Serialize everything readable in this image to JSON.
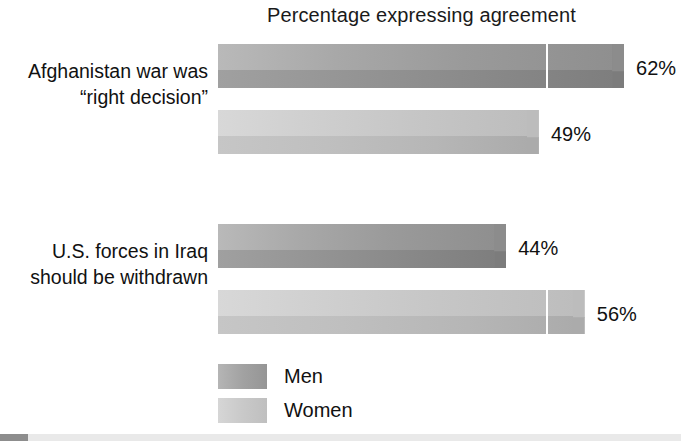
{
  "chart_data": {
    "type": "bar",
    "orientation": "horizontal",
    "style": "grouped-3d-bar",
    "title": "Percentage expressing agreement",
    "xlabel": "",
    "ylabel": "",
    "xlim": [
      0,
      70
    ],
    "grid": true,
    "gridlines": [
      50
    ],
    "legend_position": "bottom-left",
    "categories": [
      "Afghanistan war was “right decision”",
      "U.S. forces in Iraq should be withdrawn"
    ],
    "series": [
      {
        "name": "Men",
        "values": [
          62,
          44
        ],
        "color": "#9a9a9a"
      },
      {
        "name": "Women",
        "values": [
          49,
          56
        ],
        "color": "#c6c6c6"
      }
    ],
    "data_labels": [
      "62%",
      "49%",
      "44%",
      "56%"
    ]
  },
  "title": "Percentage expressing agreement",
  "categories": [
    {
      "line1": "Afghanistan war was",
      "line2": "“right decision”"
    },
    {
      "line1": "U.S. forces in Iraq",
      "line2": "should be withdrawn"
    }
  ],
  "bars": [
    {
      "series": "Men",
      "category": "Afghanistan war was “right decision”",
      "value": 62,
      "label": "62%"
    },
    {
      "series": "Women",
      "category": "Afghanistan war was “right decision”",
      "value": 49,
      "label": "49%"
    },
    {
      "series": "Men",
      "category": "U.S. forces in Iraq should be withdrawn",
      "value": 44,
      "label": "44%"
    },
    {
      "series": "Women",
      "category": "U.S. forces in Iraq should be withdrawn",
      "value": 56,
      "label": "56%"
    }
  ],
  "legend": {
    "items": [
      {
        "label": "Men",
        "color": "#9a9a9a"
      },
      {
        "label": "Women",
        "color": "#c6c6c6"
      }
    ]
  },
  "colors": {
    "men": "#9a9a9a",
    "women": "#c6c6c6",
    "text": "#111111",
    "background": "#ffffff",
    "gridline": "#ffffff",
    "bottom_rule": "#e9e9e9",
    "bottom_mark": "#8d8d8d"
  }
}
